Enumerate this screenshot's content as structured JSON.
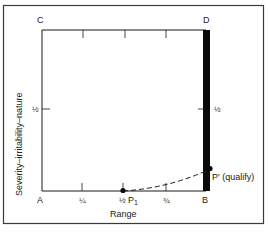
{
  "diagram": {
    "corners": {
      "top_left": "C",
      "top_right": "D",
      "bottom_left": "A",
      "bottom_right": "B"
    },
    "y_axis_label": "Severity–irritability–nature",
    "x_axis_label": "Range",
    "left_half_tick": "½",
    "right_half_tick": "½",
    "x_ticks": [
      "¼",
      "½",
      "¾"
    ],
    "point_p1": "P",
    "point_p1_sub": "1",
    "point_p_prime": "P′ (qualify)",
    "caption": "",
    "colors": {
      "line": "#1a1a1a",
      "bar": "#0a0a0a",
      "frame": "#3a3a3a"
    }
  }
}
